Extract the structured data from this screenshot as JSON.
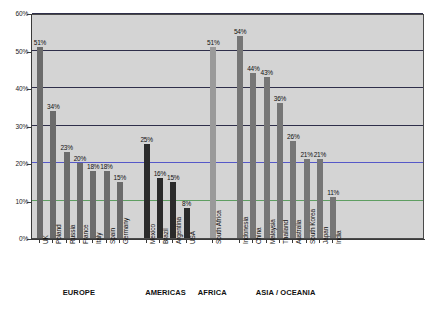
{
  "chart_data": {
    "type": "bar",
    "title": "",
    "xlabel": "",
    "ylabel": "",
    "ylim": [
      0,
      60
    ],
    "ytick_labels": [
      "0%",
      "10%",
      "20%",
      "30%",
      "40%",
      "50%",
      "60%"
    ],
    "ytick_values": [
      0,
      10,
      20,
      30,
      40,
      50,
      60
    ],
    "grid": true,
    "legend": "none",
    "value_suffix": "%",
    "categories": [
      "UK",
      "Poland",
      "Russia",
      "France",
      "Italy",
      "Spain",
      "Germany",
      "Mexico",
      "Brazil",
      "Argentina",
      "USA",
      "South Africa",
      "Indonesia",
      "China",
      "Malaysia",
      "Thailand",
      "Australia",
      "South Korea",
      "Japan",
      "India"
    ],
    "values": [
      51,
      34,
      23,
      20,
      18,
      18,
      15,
      25,
      16,
      15,
      8,
      51,
      54,
      44,
      43,
      36,
      26,
      21,
      21,
      11
    ],
    "value_labels": [
      "51%",
      "34%",
      "23%",
      "20%",
      "18%",
      "18%",
      "15%",
      "25%",
      "16%",
      "15%",
      "8%",
      "51%",
      "54%",
      "44%",
      "43%",
      "36%",
      "26%",
      "21%",
      "21%",
      "11%"
    ],
    "groups": [
      {
        "name": "EUROPE",
        "categories": [
          "UK",
          "Poland",
          "Russia",
          "France",
          "Italy",
          "Spain",
          "Germany"
        ],
        "values": [
          51,
          34,
          23,
          20,
          18,
          18,
          15
        ],
        "color": "#6b6b6b"
      },
      {
        "name": "AMERICAS",
        "categories": [
          "Mexico",
          "Brazil",
          "Argentina",
          "USA"
        ],
        "values": [
          25,
          16,
          15,
          8
        ],
        "color": "#2b2b2b"
      },
      {
        "name": "AFRICA",
        "categories": [
          "South Africa"
        ],
        "values": [
          51
        ],
        "color": "#9a9a9a"
      },
      {
        "name": "ASIA / OCEANIA",
        "categories": [
          "Indonesia",
          "China",
          "Malaysia",
          "Thailand",
          "Australia",
          "South Korea",
          "Japan",
          "India"
        ],
        "values": [
          54,
          44,
          43,
          36,
          26,
          21,
          21,
          11
        ],
        "color": "#767676"
      }
    ],
    "gridline_colors": {
      "10": "#5f9e62",
      "20": "#5558c8",
      "30": "#2f2f4a",
      "40": "#2f2f4a",
      "50": "#2f2f4a",
      "60": "#2f2f4a"
    },
    "plot_background": "#d4d4d4"
  },
  "axes": {
    "y_ticks": [
      {
        "label": "60%",
        "value": 60
      },
      {
        "label": "50%",
        "value": 50
      },
      {
        "label": "40%",
        "value": 40
      },
      {
        "label": "30%",
        "value": 30
      },
      {
        "label": "20%",
        "value": 20
      },
      {
        "label": "10%",
        "value": 10
      },
      {
        "label": "0%",
        "value": 0
      }
    ]
  },
  "regions": [
    {
      "label": "EUROPE"
    },
    {
      "label": "AMERICAS"
    },
    {
      "label": "AFRICA"
    },
    {
      "label": "ASIA / OCEANIA"
    }
  ]
}
